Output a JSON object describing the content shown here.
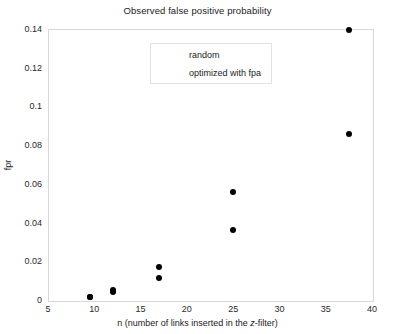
{
  "chart_data": {
    "type": "scatter",
    "title": "Observed false positive probability",
    "xlabel": "n (number of links inserted in the z-filter)",
    "ylabel": "fpr",
    "xlim": [
      5,
      40
    ],
    "ylim": [
      0,
      0.14
    ],
    "xticks": [
      5,
      10,
      15,
      20,
      25,
      30,
      35,
      40
    ],
    "xticklabels": [
      "5",
      "10",
      "15",
      "20",
      "25",
      "30",
      "35",
      "40"
    ],
    "yticks": [
      0,
      0.02,
      0.04,
      0.06,
      0.08,
      0.1,
      0.12,
      0.14
    ],
    "yticklabels": [
      "0",
      "0.02",
      "0.04",
      "0.06",
      "0.08",
      "0.1",
      "0.12",
      "0.14"
    ],
    "grid": false,
    "marker": "filled-circle",
    "marker_color": "#000000",
    "legend_position": "upper-center",
    "series": [
      {
        "name": "random",
        "marker_color": "#000000",
        "x": [
          9.5,
          12.0,
          17.0,
          25.0,
          37.5
        ],
        "y": [
          0.0015,
          0.005,
          0.017,
          0.056,
          0.1395
        ]
      },
      {
        "name": "optimized with fpa",
        "marker_color": "#000000",
        "x": [
          9.5,
          12.0,
          17.0,
          25.0,
          37.5
        ],
        "y": [
          0.0015,
          0.004,
          0.0115,
          0.036,
          0.086
        ]
      }
    ]
  },
  "legend": {
    "entries": [
      {
        "label": "random"
      },
      {
        "label": "optimized with fpa"
      }
    ]
  },
  "xlabel_parts": {
    "pre": "n (number of links inserted in the ",
    "italic": "z",
    "post": "-filter)"
  }
}
